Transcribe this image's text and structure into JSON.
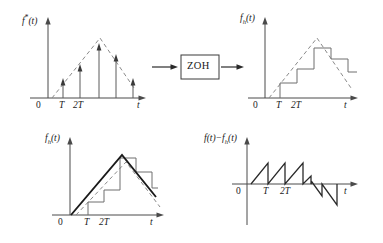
{
  "figure": {
    "title_visible": false,
    "background_color": "#ffffff",
    "ink_color": "#1a1a1a",
    "envelope_color": "#8a8a8a",
    "staircase_color": "#6e6e6e"
  },
  "block": {
    "label": "ZOH",
    "input_arrow": "arrow-right",
    "output_arrow": "arrow-right"
  },
  "panels": [
    {
      "id": "top-left",
      "ylabel_html": "f<sup>*</sup>(<i>t</i>)",
      "ylabel_text": "f*(t)",
      "xlabel": "t",
      "origin_label": "0",
      "tick_labels": [
        "T",
        "2T"
      ],
      "description": "sampled impulse train under triangular envelope",
      "chart_data": {
        "type": "scatter",
        "title": "f*(t) impulse train",
        "xlabel": "t",
        "ylabel": "f*(t)",
        "x": [
          1,
          2,
          3,
          4,
          5
        ],
        "values": [
          0.2,
          0.45,
          0.78,
          0.62,
          0.2
        ],
        "tick_labels": [
          "T",
          "2T"
        ],
        "envelope_type": "triangle",
        "envelope_x": [
          0,
          3,
          5.6
        ],
        "envelope_y": [
          0,
          0.88,
          0.12
        ],
        "grid": false,
        "legend": "none"
      }
    },
    {
      "id": "top-right",
      "ylabel_html": "f<sub>h</sub>(<i>t</i>)",
      "ylabel_text": "fh(t)",
      "xlabel": "t",
      "origin_label": "0",
      "tick_labels": [
        "T",
        "2T"
      ],
      "description": "zero-order-hold staircase output with triangular envelope",
      "chart_data": {
        "type": "line",
        "title": "fh(t) ZOH staircase",
        "xlabel": "t",
        "ylabel": "fh(t)",
        "step_start_x": [
          1,
          2,
          3,
          4,
          5
        ],
        "values": [
          0.2,
          0.45,
          0.78,
          0.62,
          0.2
        ],
        "tick_labels": [
          "T",
          "2T"
        ],
        "envelope_type": "triangle",
        "envelope_x": [
          0,
          3,
          5.6
        ],
        "envelope_y": [
          0,
          0.88,
          0.12
        ],
        "grid": false,
        "legend": "none"
      }
    },
    {
      "id": "bottom-left",
      "ylabel_html": "f<sub>h</sub>(<i>t</i>)",
      "ylabel_text": "fh(t)",
      "xlabel": "t",
      "origin_label": "0",
      "tick_labels": [
        "T",
        "2T"
      ],
      "description": "bold triangular wave overlaid on staircase and dashed envelope",
      "chart_data": {
        "type": "line",
        "title": "fh(t) with continuous triangular overlay",
        "xlabel": "t",
        "ylabel": "fh(t)",
        "series": [
          {
            "name": "continuous-triangle",
            "x": [
              0,
              3.0,
              5.6
            ],
            "values": [
              0,
              0.9,
              0.16
            ]
          },
          {
            "name": "zoh-staircase",
            "step_start_x": [
              1,
              2,
              3,
              4,
              5
            ],
            "values": [
              0.2,
              0.45,
              0.78,
              0.62,
              0.2
            ]
          },
          {
            "name": "dashed-envelope",
            "x": [
              0,
              3.2,
              5.8
            ],
            "values": [
              0,
              0.84,
              0.1
            ]
          }
        ],
        "tick_labels": [
          "T",
          "2T"
        ],
        "grid": false,
        "legend": "none"
      }
    },
    {
      "id": "bottom-right",
      "ylabel_html": "f(<i>t</i>)&#8722;f<sub>h</sub>(<i>t</i>)",
      "ylabel_text": "f(t)-fh(t)",
      "xlabel": "t",
      "origin_label": "0",
      "tick_labels": [
        "T",
        "2T"
      ],
      "description": "sawtooth reconstruction error, positive on rising slope then negative on falling slope",
      "chart_data": {
        "type": "line",
        "title": "f(t) - fh(t) sampling error",
        "xlabel": "t",
        "ylabel": "f(t)-fh(t)",
        "x": [
          0,
          1,
          1,
          2,
          2,
          3,
          3,
          3.5,
          3.5,
          4.2,
          4.2,
          5.2,
          5.2
        ],
        "values": [
          0,
          0.33,
          0,
          0.33,
          0,
          0.33,
          0,
          0.1,
          -0.06,
          -0.22,
          -0.04,
          -0.42,
          0
        ],
        "tick_labels": [
          "T",
          "2T"
        ],
        "grid": false,
        "legend": "none"
      }
    }
  ]
}
